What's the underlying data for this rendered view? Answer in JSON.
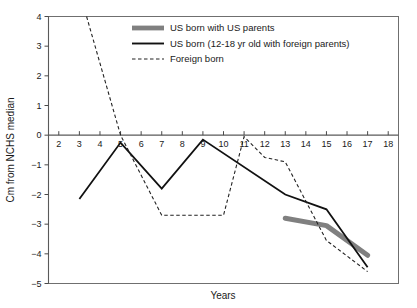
{
  "chart_data": {
    "type": "line",
    "title": "",
    "xlabel": "Years",
    "ylabel": "Cm from NCHS median",
    "xlim": [
      1.5,
      18.5
    ],
    "ylim": [
      -5,
      4
    ],
    "xticks": [
      2,
      3,
      4,
      5,
      6,
      7,
      8,
      9,
      10,
      11,
      12,
      13,
      14,
      15,
      16,
      17,
      18
    ],
    "xtick_labels": [
      "2",
      "3",
      "4",
      "5",
      "6",
      "7",
      "8",
      "9",
      "10",
      "11",
      "12",
      "13",
      "14",
      "15",
      "16",
      "17",
      "18"
    ],
    "yticks": [
      4,
      3,
      2,
      1,
      0,
      -1,
      -2,
      -3,
      -4,
      -5
    ],
    "ytick_labels": [
      "4",
      "3",
      "2",
      "1",
      "0",
      "−1",
      "−2",
      "−3",
      "−4",
      "−5"
    ],
    "grid": false,
    "legend_position": "top-center",
    "series": [
      {
        "name": "US born with US parents",
        "style": "thick-gray",
        "color": "#808080",
        "x": [
          13,
          15,
          17
        ],
        "values": [
          -2.8,
          -3.05,
          -4.05
        ]
      },
      {
        "name": "US born (12-18 yr old with foreign parents)",
        "style": "solid-black",
        "color": "#111111",
        "x": [
          3,
          5,
          7,
          9,
          13,
          15,
          17
        ],
        "values": [
          -2.15,
          -0.25,
          -1.8,
          -0.15,
          -2.0,
          -2.5,
          -4.45
        ]
      },
      {
        "name": "Foreign born",
        "style": "dashed-black",
        "color": "#222222",
        "x": [
          3.35,
          5,
          7,
          10,
          11,
          12,
          13,
          15,
          17
        ],
        "values": [
          4.0,
          0.0,
          -2.7,
          -2.7,
          -0.05,
          -0.75,
          -0.9,
          -3.55,
          -4.6
        ]
      }
    ]
  },
  "legend": {
    "items": [
      {
        "label": "US born with US parents",
        "key": "thick-gray"
      },
      {
        "label": "US born (12-18 yr old with foreign parents)",
        "key": "solid-black"
      },
      {
        "label": "Foreign born",
        "key": "dashed-black"
      }
    ]
  },
  "colors": {
    "gray_series": "#808080",
    "black_series": "#111111",
    "dashed_series": "#222222",
    "frame": "#6f6f6f",
    "text": "#1a1a1a",
    "background": "#ffffff"
  }
}
